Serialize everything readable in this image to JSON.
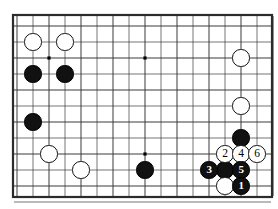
{
  "figure": {
    "title": "Go board move sequence diagram",
    "board_type": "go-board",
    "background_color": "#ffffff",
    "line_color": "#3a3a3a",
    "border_color": "#2b2b2b",
    "black_stone_color": "#111111",
    "white_stone_color": "#ffffff"
  },
  "board": {
    "cell_size": 16,
    "origin_x": 17,
    "origin_y": 26,
    "cols": 17,
    "rows": 12,
    "frame": {
      "left": 13,
      "top": 15,
      "width": 259,
      "height": 182
    },
    "star_points": [
      {
        "col": 2,
        "row": 2
      },
      {
        "col": 8,
        "row": 2
      },
      {
        "col": 14,
        "row": 2
      },
      {
        "col": 2,
        "row": 8
      },
      {
        "col": 8,
        "row": 8
      }
    ]
  },
  "stones": [
    {
      "id": "w-a",
      "color": "white",
      "col": 1,
      "row": 1,
      "label": ""
    },
    {
      "id": "w-b",
      "color": "white",
      "col": 3,
      "row": 1,
      "label": ""
    },
    {
      "id": "b-a",
      "color": "black",
      "col": 1,
      "row": 3,
      "label": ""
    },
    {
      "id": "b-b",
      "color": "black",
      "col": 3,
      "row": 3,
      "label": ""
    },
    {
      "id": "b-c",
      "color": "black",
      "col": 1,
      "row": 6,
      "label": ""
    },
    {
      "id": "w-c",
      "color": "white",
      "col": 2,
      "row": 8,
      "label": ""
    },
    {
      "id": "w-d",
      "color": "white",
      "col": 4,
      "row": 9,
      "label": ""
    },
    {
      "id": "b-d",
      "color": "black",
      "col": 8,
      "row": 9,
      "label": ""
    },
    {
      "id": "w-e",
      "color": "white",
      "col": 14,
      "row": 2,
      "label": ""
    },
    {
      "id": "w-f",
      "color": "white",
      "col": 14,
      "row": 5,
      "label": ""
    },
    {
      "id": "b-e",
      "color": "black",
      "col": 14,
      "row": 7,
      "label": ""
    },
    {
      "id": "b-f",
      "color": "black",
      "col": 13,
      "row": 9,
      "label": ""
    },
    {
      "id": "w-g",
      "color": "white",
      "col": 13,
      "row": 10,
      "label": ""
    },
    {
      "id": "m2",
      "color": "white",
      "col": 13,
      "row": 8,
      "label": "2"
    },
    {
      "id": "m4",
      "color": "white",
      "col": 14,
      "row": 8,
      "label": "4"
    },
    {
      "id": "m6",
      "color": "white",
      "col": 15,
      "row": 8,
      "label": "6"
    },
    {
      "id": "m3",
      "color": "black",
      "col": 12,
      "row": 9,
      "label": "3"
    },
    {
      "id": "m5",
      "color": "black",
      "col": 14,
      "row": 9,
      "label": "5"
    },
    {
      "id": "m1",
      "color": "black",
      "col": 14,
      "row": 10,
      "label": "1"
    }
  ],
  "move_sequence": {
    "moves": [
      {
        "number": "1",
        "color": "black"
      },
      {
        "number": "2",
        "color": "white"
      },
      {
        "number": "3",
        "color": "black"
      },
      {
        "number": "4",
        "color": "white"
      },
      {
        "number": "5",
        "color": "black"
      },
      {
        "number": "6",
        "color": "white"
      }
    ]
  }
}
